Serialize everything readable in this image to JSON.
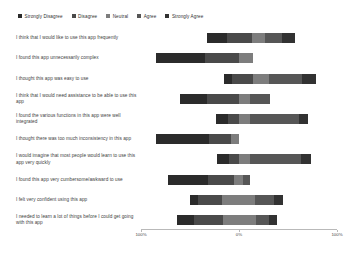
{
  "legend": {
    "position": "top-left",
    "items": [
      {
        "label": "Strongly Disagree",
        "color": "#2b2b2b",
        "icon": "square-swatch-icon"
      },
      {
        "label": "Disagree",
        "color": "#4a4a4a",
        "icon": "square-swatch-icon"
      },
      {
        "label": "Neutral",
        "color": "#7d7d7d",
        "icon": "square-swatch-icon"
      },
      {
        "label": "Agree",
        "color": "#565656",
        "icon": "square-swatch-icon"
      },
      {
        "label": "Strongly Agree",
        "color": "#323232",
        "icon": "square-swatch-icon"
      }
    ]
  },
  "axis": {
    "xticks": [
      "100%",
      "0%",
      "100%"
    ],
    "xtick_positions": [
      -100,
      0,
      100
    ],
    "xlim": [
      -100,
      100
    ]
  },
  "chart_data": {
    "type": "bar",
    "subtype": "diverging-stacked-likert",
    "title": "",
    "xlabel": "",
    "ylabel": "",
    "xlim": [
      -100,
      100
    ],
    "grid": false,
    "legend_position": "top-left",
    "categories": [
      "I think that I would like to use this app frequently",
      "I found this app unnecessarily complex",
      "I thought this app was easy to use",
      "I think that I would need assistance to be able to use this app",
      "I found the various functions in this app were well integrated",
      "I thought there was too much inconsistency in this app",
      "I would imagine that most people would learn to use this app very quickly",
      "I found this app very cumbersome/awkward to use",
      "I felt very confident using this app",
      "I needed to learn a lot of things before I could get going with this app"
    ],
    "response_levels": [
      "Strongly Disagree",
      "Disagree",
      "Neutral",
      "Agree",
      "Strongly Agree"
    ],
    "series": [
      {
        "name": "Strongly Disagree",
        "color": "#2b2b2b",
        "values": [
          21,
          50,
          8,
          27,
          12,
          54,
          12,
          40,
          8,
          17
        ]
      },
      {
        "name": "Disagree",
        "color": "#4a4a4a",
        "values": [
          25,
          35,
          21,
          33,
          11,
          23,
          10,
          27,
          25,
          30
        ]
      },
      {
        "name": "Neutral",
        "color": "#7d7d7d",
        "values": [
          14,
          14,
          17,
          11,
          11,
          8,
          11,
          9,
          33,
          33
        ]
      },
      {
        "name": "Agree",
        "color": "#565656",
        "values": [
          17,
          0,
          33,
          21,
          50,
          0,
          52,
          7,
          20,
          14
        ]
      },
      {
        "name": "Strongly Agree",
        "color": "#323232",
        "values": [
          13,
          0,
          15,
          0,
          9,
          0,
          10,
          0,
          9,
          8
        ]
      }
    ],
    "bars": [
      {
        "category_index": 0,
        "start_pct": -33,
        "segments": [
          {
            "level": "Strongly Disagree",
            "pct": 21
          },
          {
            "level": "Disagree",
            "pct": 25
          },
          {
            "level": "Neutral",
            "pct": 14
          },
          {
            "level": "Agree",
            "pct": 17
          },
          {
            "level": "Strongly Agree",
            "pct": 13
          }
        ]
      },
      {
        "category_index": 1,
        "start_pct": -85,
        "segments": [
          {
            "level": "Strongly Disagree",
            "pct": 50
          },
          {
            "level": "Disagree",
            "pct": 35
          },
          {
            "level": "Neutral",
            "pct": 14
          }
        ]
      },
      {
        "category_index": 2,
        "start_pct": -15,
        "segments": [
          {
            "level": "Strongly Disagree",
            "pct": 8
          },
          {
            "level": "Disagree",
            "pct": 21
          },
          {
            "level": "Neutral",
            "pct": 17
          },
          {
            "level": "Agree",
            "pct": 33
          },
          {
            "level": "Strongly Agree",
            "pct": 15
          }
        ]
      },
      {
        "category_index": 3,
        "start_pct": -60,
        "segments": [
          {
            "level": "Strongly Disagree",
            "pct": 27
          },
          {
            "level": "Disagree",
            "pct": 33
          },
          {
            "level": "Neutral",
            "pct": 11
          },
          {
            "level": "Agree",
            "pct": 21
          }
        ]
      },
      {
        "category_index": 4,
        "start_pct": -23,
        "segments": [
          {
            "level": "Strongly Disagree",
            "pct": 12
          },
          {
            "level": "Disagree",
            "pct": 11
          },
          {
            "level": "Neutral",
            "pct": 11
          },
          {
            "level": "Agree",
            "pct": 50
          },
          {
            "level": "Strongly Agree",
            "pct": 9
          }
        ]
      },
      {
        "category_index": 5,
        "start_pct": -85,
        "segments": [
          {
            "level": "Strongly Disagree",
            "pct": 54
          },
          {
            "level": "Disagree",
            "pct": 23
          },
          {
            "level": "Neutral",
            "pct": 8
          }
        ]
      },
      {
        "category_index": 6,
        "start_pct": -22,
        "segments": [
          {
            "level": "Strongly Disagree",
            "pct": 12
          },
          {
            "level": "Disagree",
            "pct": 10
          },
          {
            "level": "Neutral",
            "pct": 11
          },
          {
            "level": "Agree",
            "pct": 52
          },
          {
            "level": "Strongly Agree",
            "pct": 10
          }
        ]
      },
      {
        "category_index": 7,
        "start_pct": -72,
        "segments": [
          {
            "level": "Strongly Disagree",
            "pct": 40
          },
          {
            "level": "Disagree",
            "pct": 27
          },
          {
            "level": "Neutral",
            "pct": 9
          },
          {
            "level": "Agree",
            "pct": 7
          }
        ]
      },
      {
        "category_index": 8,
        "start_pct": -50,
        "segments": [
          {
            "level": "Strongly Disagree",
            "pct": 8
          },
          {
            "level": "Disagree",
            "pct": 25
          },
          {
            "level": "Neutral",
            "pct": 33
          },
          {
            "level": "Agree",
            "pct": 20
          },
          {
            "level": "Strongly Agree",
            "pct": 9
          }
        ]
      },
      {
        "category_index": 9,
        "start_pct": -63,
        "segments": [
          {
            "level": "Strongly Disagree",
            "pct": 17
          },
          {
            "level": "Disagree",
            "pct": 30
          },
          {
            "level": "Neutral",
            "pct": 33
          },
          {
            "level": "Agree",
            "pct": 14
          },
          {
            "level": "Strongly Agree",
            "pct": 8
          }
        ]
      }
    ]
  }
}
